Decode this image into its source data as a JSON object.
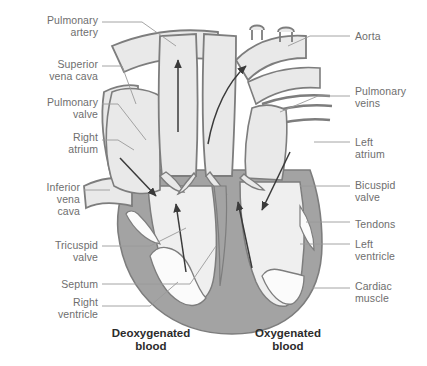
{
  "figure": {
    "colors": {
      "background": "#ffffff",
      "vessel_fill": "#e9e9e9",
      "vessel_outline": "#7d7d7d",
      "cardiac_muscle": "#a3a3a3",
      "chamber_white": "#fbfbfb",
      "label_text": "#6e6e6e",
      "caption_text": "#2b2b2b",
      "leader_line": "#9a9a9a",
      "arrow": "#3a3a3a"
    }
  },
  "labels": {
    "left": [
      {
        "id": "pulmonary-artery",
        "text": "Pulmonary\nartery",
        "x": 18,
        "y": 14,
        "w": 80
      },
      {
        "id": "superior-vena-cava",
        "text": "Superior\nvena cava",
        "x": 18,
        "y": 58,
        "w": 80
      },
      {
        "id": "pulmonary-valve",
        "text": "Pulmonary\nvalve",
        "x": 18,
        "y": 96,
        "w": 80
      },
      {
        "id": "right-atrium",
        "text": "Right\natrium",
        "x": 18,
        "y": 131,
        "w": 80
      },
      {
        "id": "inferior-vena-cava",
        "text": "Inferior\nvena\ncava",
        "x": 10,
        "y": 181,
        "w": 70
      },
      {
        "id": "tricuspid-valve",
        "text": "Tricuspid\nvalve",
        "x": 18,
        "y": 239,
        "w": 80
      },
      {
        "id": "septum",
        "text": "Septum",
        "x": 18,
        "y": 278,
        "w": 80
      },
      {
        "id": "right-ventricle",
        "text": "Right\nventricle",
        "x": 18,
        "y": 296,
        "w": 80
      }
    ],
    "right": [
      {
        "id": "aorta",
        "text": "Aorta",
        "x": 355,
        "y": 30,
        "w": 70
      },
      {
        "id": "pulmonary-veins",
        "text": "Pulmonary\nveins",
        "x": 355,
        "y": 85,
        "w": 70
      },
      {
        "id": "left-atrium",
        "text": "Left\natrium",
        "x": 355,
        "y": 136,
        "w": 70
      },
      {
        "id": "bicuspid-valve",
        "text": "Bicuspid\nvalve",
        "x": 355,
        "y": 179,
        "w": 70
      },
      {
        "id": "tendons",
        "text": "Tendons",
        "x": 355,
        "y": 218,
        "w": 70
      },
      {
        "id": "left-ventricle",
        "text": "Left\nventricle",
        "x": 355,
        "y": 238,
        "w": 70
      },
      {
        "id": "cardiac-muscle",
        "text": "Cardiac\nmuscle",
        "x": 355,
        "y": 280,
        "w": 70
      }
    ]
  },
  "captions": [
    {
      "id": "deoxygenated-blood",
      "text": "Deoxygenated\nblood",
      "x": 96,
      "y": 327,
      "w": 110
    },
    {
      "id": "oxygenated-blood",
      "text": "Oxygenated\nblood",
      "x": 238,
      "y": 327,
      "w": 100
    }
  ]
}
